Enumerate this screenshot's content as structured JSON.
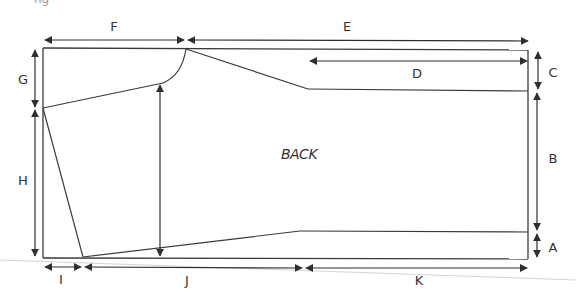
{
  "figure": {
    "cropped_caption_fragment": "ng",
    "piece_label": "BACK",
    "colors": {
      "line": "#3a3a3a",
      "guide": "#bfbfbf",
      "text": "#333333"
    }
  },
  "dimensions": {
    "A": {
      "label": "A",
      "orientation": "vertical",
      "desc": "bottom hem band height (right side)"
    },
    "B": {
      "label": "B",
      "orientation": "vertical",
      "desc": "main body height (right side)"
    },
    "C": {
      "label": "C",
      "orientation": "vertical",
      "desc": "top band height (right side)"
    },
    "D": {
      "label": "D",
      "orientation": "horizontal",
      "desc": "top band length"
    },
    "E": {
      "label": "E",
      "orientation": "horizontal",
      "desc": "top edge from neck to right edge"
    },
    "F": {
      "label": "F",
      "orientation": "horizontal",
      "desc": "top edge from left to neck"
    },
    "G": {
      "label": "G",
      "orientation": "vertical",
      "desc": "left top to sleeve seam point"
    },
    "H": {
      "label": "H",
      "orientation": "vertical",
      "desc": "sleeve seam point to bottom"
    },
    "I": {
      "label": "I",
      "orientation": "horizontal",
      "desc": "bottom left offset"
    },
    "J": {
      "label": "J",
      "orientation": "horizontal",
      "desc": "bottom taper length"
    },
    "K": {
      "label": "K",
      "orientation": "horizontal",
      "desc": "bottom straight length"
    }
  }
}
